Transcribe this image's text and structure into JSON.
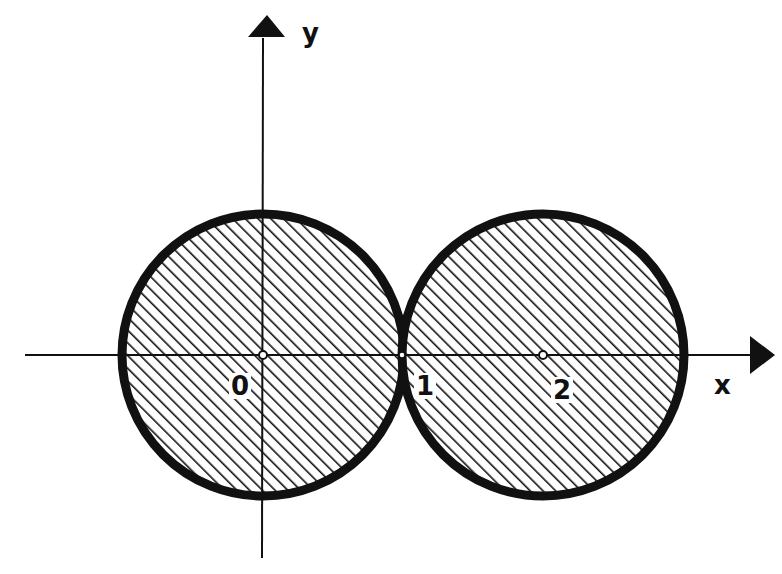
{
  "figure": {
    "axes": {
      "x_label": "x",
      "y_label": "y"
    },
    "circles": [
      {
        "name": "left-disk",
        "center": [
          0,
          0
        ],
        "radius": 1,
        "shaded": true
      },
      {
        "name": "right-disk",
        "center": [
          2,
          0
        ],
        "radius": 1,
        "shaded": true
      }
    ],
    "points": [
      {
        "label": "0",
        "x": 0,
        "y": 0
      },
      {
        "label": "1",
        "x": 1,
        "y": 0
      },
      {
        "label": "2",
        "x": 2,
        "y": 0
      }
    ],
    "colors": {
      "ink": "#111111",
      "background": "#ffffff"
    }
  }
}
